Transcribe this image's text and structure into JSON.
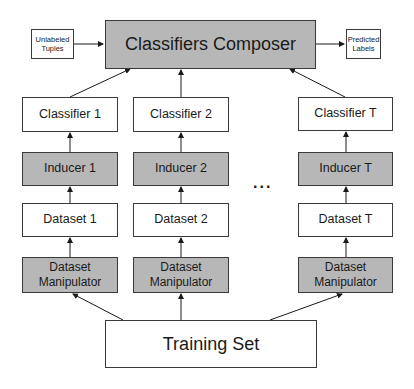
{
  "diagram": {
    "composer": {
      "label": "Classifiers Composer"
    },
    "input": {
      "line1": "Unlabeled",
      "line2": "Tuples"
    },
    "output": {
      "line1": "Predicted",
      "line2": "Labels"
    },
    "columns": [
      {
        "classifier": "Classifier 1",
        "inducer": "Inducer 1",
        "dataset": "Dataset 1",
        "manipulator_line1": "Dataset",
        "manipulator_line2": "Manipulator"
      },
      {
        "classifier": "Classifier 2",
        "inducer": "Inducer 2",
        "dataset": "Dataset 2",
        "manipulator_line1": "Dataset",
        "manipulator_line2": "Manipulator"
      },
      {
        "classifier": "Classifier T",
        "inducer": "Inducer T",
        "dataset": "Dataset T",
        "manipulator_line1": "Dataset",
        "manipulator_line2": "Manipulator"
      }
    ],
    "ellipsis": "...",
    "training_set": {
      "label": "Training Set"
    },
    "colors": {
      "gray_fill": "#b7b7b7",
      "white_fill": "#ffffff",
      "stroke": "#3a3a3a"
    }
  }
}
